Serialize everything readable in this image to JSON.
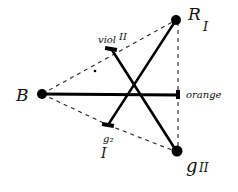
{
  "diagram": {
    "type": "hand-drawn color-vision line diagram",
    "points": {
      "B": {
        "label": "B",
        "x": 42,
        "y": 94
      },
      "R": {
        "label": "R",
        "sub": "I",
        "x": 176,
        "y": 20
      },
      "G": {
        "label": "g",
        "sub": "II",
        "x": 177,
        "y": 152
      },
      "orange": {
        "label": "orange",
        "x": 178,
        "y": 94
      },
      "viol": {
        "label": "viol",
        "sub": "II",
        "x": 112,
        "y": 50
      },
      "g2": {
        "label": "g₂",
        "sub": "I",
        "x": 108,
        "y": 125
      }
    },
    "labels": {
      "B": "B",
      "R": "R",
      "R_sub": "I",
      "G": "g",
      "G_sub": "II",
      "orange": "orange",
      "viol": "viol",
      "viol_sub": "II",
      "g2": "g₂",
      "g2_sub": "I"
    },
    "solid_lines": [
      [
        "B",
        "orange"
      ],
      [
        "R",
        "g2"
      ],
      [
        "viol",
        "G"
      ]
    ],
    "dashed_lines": [
      [
        "B",
        "R"
      ],
      [
        "B",
        "g2"
      ],
      [
        "g2",
        "G"
      ],
      [
        "R",
        "orange"
      ],
      [
        "orange",
        "G"
      ]
    ],
    "stray_dot": {
      "x": 95,
      "y": 71
    }
  }
}
